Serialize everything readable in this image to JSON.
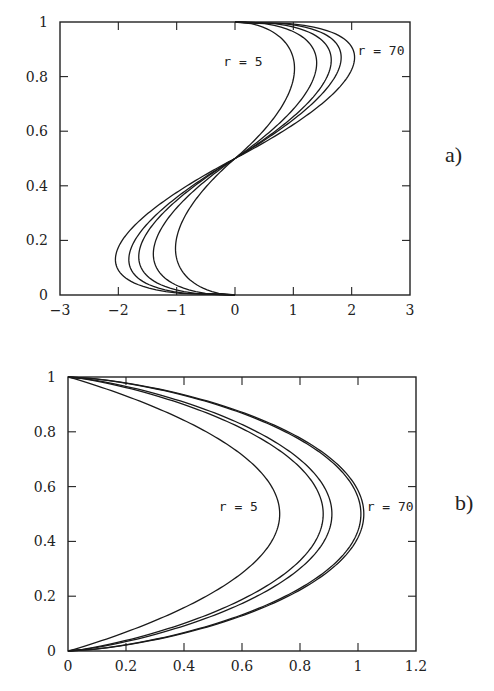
{
  "chart_data": [
    {
      "id": "a",
      "type": "line",
      "panel_label": "a)",
      "title": "",
      "xlabel": "",
      "ylabel": "",
      "xlim": [
        -3,
        3
      ],
      "ylim": [
        0,
        1
      ],
      "xticks": [
        "-3",
        "-2",
        "-1",
        "0",
        "1",
        "2",
        "3"
      ],
      "yticks": [
        "0",
        "0.2",
        "0.4",
        "0.6",
        "0.8",
        "1"
      ],
      "grid": false,
      "annotations": [
        {
          "text": "r = 5",
          "x": -0.2,
          "y": 0.84
        },
        {
          "text": "r = 70",
          "x": 2.1,
          "y": 0.88
        }
      ],
      "series": [
        {
          "name": "r = 5",
          "amplitude": 1.02,
          "peak_y": 0.83
        },
        {
          "name": "r ≈ 10",
          "amplitude": 1.4,
          "peak_y": 0.85
        },
        {
          "name": "r ≈ 20",
          "amplitude": 1.65,
          "peak_y": 0.86
        },
        {
          "name": "r ≈ 40",
          "amplitude": 1.82,
          "peak_y": 0.87
        },
        {
          "name": "r = 70",
          "amplitude": 2.05,
          "peak_y": 0.87
        }
      ],
      "description": "Antisymmetric S-shaped profiles x(y) through (0,0), (0,0.5), (0,1); each curve reaches -amplitude near y≈1-peak_y and +amplitude near y≈peak_y."
    },
    {
      "id": "b",
      "type": "line",
      "panel_label": "b)",
      "title": "",
      "xlabel": "",
      "ylabel": "",
      "xlim": [
        0,
        1.2
      ],
      "ylim": [
        0,
        1
      ],
      "xticks": [
        "0",
        "0.2",
        "0.4",
        "0.6",
        "0.8",
        "1",
        "1.2"
      ],
      "yticks": [
        "0",
        "0.2",
        "0.4",
        "0.6",
        "0.8",
        "1"
      ],
      "grid": false,
      "annotations": [
        {
          "text": "r = 5",
          "x": 0.52,
          "y": 0.51
        },
        {
          "text": "r = 70",
          "x": 1.03,
          "y": 0.51
        }
      ],
      "series": [
        {
          "name": "r = 5",
          "peak_x": 0.73,
          "peak_y": 0.5
        },
        {
          "name": "r ≈ 10",
          "peak_x": 0.88,
          "peak_y": 0.5
        },
        {
          "name": "r ≈ 20",
          "peak_x": 0.91,
          "peak_y": 0.5
        },
        {
          "name": "r ≈ 40",
          "peak_x": 1.01,
          "peak_y": 0.5
        },
        {
          "name": "r = 70",
          "peak_x": 1.02,
          "peak_y": 0.5
        }
      ],
      "description": "Symmetric parabola-like profiles x(y) from (0,0) to (0,1) with maximum at y=0.5; larger r gives blunter, larger profiles."
    }
  ]
}
